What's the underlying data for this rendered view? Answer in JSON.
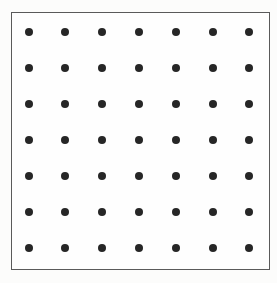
{
  "figure": {
    "canvas": {
      "width": 277,
      "height": 283
    },
    "background_color": "#fcfcfb"
  },
  "frame": {
    "label": "square border frame",
    "x": 11,
    "y": 12,
    "width": 259,
    "height": 258,
    "border_color": "#5a5a5a",
    "border_width": 1.5,
    "fill_color": "#fefefe"
  },
  "chart_data": {
    "type": "scatter",
    "title": "",
    "subtitle": "",
    "xlabel": "",
    "ylabel": "",
    "grid": false,
    "legend": "none",
    "rows": 7,
    "columns": 7,
    "point_count": 49,
    "point_color": "#262626",
    "point_diameter": 8,
    "x_start": 29,
    "y_start": 32,
    "x_step": 36.8,
    "y_step": 36,
    "xlim": [
      11,
      270
    ],
    "ylim": [
      12,
      270
    ],
    "x": [
      29,
      65.8,
      102.6,
      139.4,
      176.2,
      213,
      249.8
    ],
    "y": [
      32,
      68,
      104,
      140,
      176,
      212,
      248
    ],
    "points": [
      {
        "row": 0,
        "col": 0,
        "x": 29,
        "y": 32
      },
      {
        "row": 0,
        "col": 1,
        "x": 65.8,
        "y": 32
      },
      {
        "row": 0,
        "col": 2,
        "x": 102.6,
        "y": 32
      },
      {
        "row": 0,
        "col": 3,
        "x": 139.4,
        "y": 32
      },
      {
        "row": 0,
        "col": 4,
        "x": 176.2,
        "y": 32
      },
      {
        "row": 0,
        "col": 5,
        "x": 213,
        "y": 32
      },
      {
        "row": 0,
        "col": 6,
        "x": 249.8,
        "y": 32
      },
      {
        "row": 1,
        "col": 0,
        "x": 29,
        "y": 68
      },
      {
        "row": 1,
        "col": 1,
        "x": 65.8,
        "y": 68
      },
      {
        "row": 1,
        "col": 2,
        "x": 102.6,
        "y": 68
      },
      {
        "row": 1,
        "col": 3,
        "x": 139.4,
        "y": 68
      },
      {
        "row": 1,
        "col": 4,
        "x": 176.2,
        "y": 68
      },
      {
        "row": 1,
        "col": 5,
        "x": 213,
        "y": 68
      },
      {
        "row": 1,
        "col": 6,
        "x": 249.8,
        "y": 68
      },
      {
        "row": 2,
        "col": 0,
        "x": 29,
        "y": 104
      },
      {
        "row": 2,
        "col": 1,
        "x": 65.8,
        "y": 104
      },
      {
        "row": 2,
        "col": 2,
        "x": 102.6,
        "y": 104
      },
      {
        "row": 2,
        "col": 3,
        "x": 139.4,
        "y": 104
      },
      {
        "row": 2,
        "col": 4,
        "x": 176.2,
        "y": 104
      },
      {
        "row": 2,
        "col": 5,
        "x": 213,
        "y": 104
      },
      {
        "row": 2,
        "col": 6,
        "x": 249.8,
        "y": 104
      },
      {
        "row": 3,
        "col": 0,
        "x": 29,
        "y": 140
      },
      {
        "row": 3,
        "col": 1,
        "x": 65.8,
        "y": 140
      },
      {
        "row": 3,
        "col": 2,
        "x": 102.6,
        "y": 140
      },
      {
        "row": 3,
        "col": 3,
        "x": 139.4,
        "y": 140
      },
      {
        "row": 3,
        "col": 4,
        "x": 176.2,
        "y": 140
      },
      {
        "row": 3,
        "col": 5,
        "x": 213,
        "y": 140
      },
      {
        "row": 3,
        "col": 6,
        "x": 249.8,
        "y": 140
      },
      {
        "row": 4,
        "col": 0,
        "x": 29,
        "y": 176
      },
      {
        "row": 4,
        "col": 1,
        "x": 65.8,
        "y": 176
      },
      {
        "row": 4,
        "col": 2,
        "x": 102.6,
        "y": 176
      },
      {
        "row": 4,
        "col": 3,
        "x": 139.4,
        "y": 176
      },
      {
        "row": 4,
        "col": 4,
        "x": 176.2,
        "y": 176
      },
      {
        "row": 4,
        "col": 5,
        "x": 213,
        "y": 176
      },
      {
        "row": 4,
        "col": 6,
        "x": 249.8,
        "y": 176
      },
      {
        "row": 5,
        "col": 0,
        "x": 29,
        "y": 212
      },
      {
        "row": 5,
        "col": 1,
        "x": 65.8,
        "y": 212
      },
      {
        "row": 5,
        "col": 2,
        "x": 102.6,
        "y": 212
      },
      {
        "row": 5,
        "col": 3,
        "x": 139.4,
        "y": 212
      },
      {
        "row": 5,
        "col": 4,
        "x": 176.2,
        "y": 212
      },
      {
        "row": 5,
        "col": 5,
        "x": 213,
        "y": 212
      },
      {
        "row": 5,
        "col": 6,
        "x": 249.8,
        "y": 212
      },
      {
        "row": 6,
        "col": 0,
        "x": 29,
        "y": 248
      },
      {
        "row": 6,
        "col": 1,
        "x": 65.8,
        "y": 248
      },
      {
        "row": 6,
        "col": 2,
        "x": 102.6,
        "y": 248
      },
      {
        "row": 6,
        "col": 3,
        "x": 139.4,
        "y": 248
      },
      {
        "row": 6,
        "col": 4,
        "x": 176.2,
        "y": 248
      },
      {
        "row": 6,
        "col": 5,
        "x": 213,
        "y": 248
      },
      {
        "row": 6,
        "col": 6,
        "x": 249.8,
        "y": 248
      }
    ]
  }
}
